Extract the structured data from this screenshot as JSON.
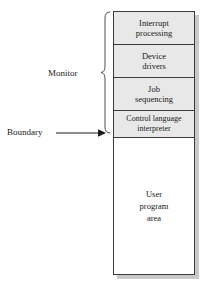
{
  "figure": {
    "colors": {
      "monitor_fill": "#e8e8e8",
      "user_fill": "#ffffff",
      "stroke": "#3b3b3b",
      "shadow": "#c9c9c9",
      "text": "#1a1a1a"
    },
    "memory_blocks": [
      {
        "id": "interrupt-processing",
        "label": "Interrupt\nprocessing",
        "region": "monitor"
      },
      {
        "id": "device-drivers",
        "label": "Device\ndrivers",
        "region": "monitor"
      },
      {
        "id": "job-sequencing",
        "label": "Job\nsequencing",
        "region": "monitor"
      },
      {
        "id": "control-language-interpreter",
        "label": "Control language\ninterpreter",
        "region": "monitor"
      },
      {
        "id": "user-program-area",
        "label": "User\nprogram\narea",
        "region": "user"
      }
    ],
    "annotations": {
      "monitor_label": "Monitor",
      "boundary_label": "Boundary"
    },
    "icons": {
      "brace": "curly-brace-left",
      "arrow": "arrow-right"
    }
  }
}
